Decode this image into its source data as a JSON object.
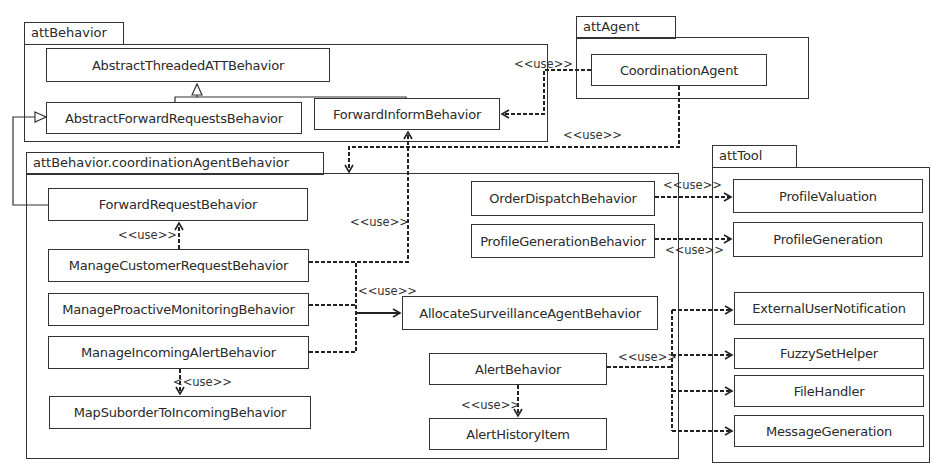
{
  "packages": {
    "attBehavior": "attBehavior",
    "attAgent": "attAgent",
    "coordination": "attBehavior.coordinationAgentBehavior",
    "attTool": "attTool"
  },
  "classes": {
    "abstractThreaded": "AbstractThreadedATTBehavior",
    "abstractForwardRequests": "AbstractForwardRequestsBehavior",
    "forwardInform": "ForwardInformBehavior",
    "coordinationAgent": "CoordinationAgent",
    "forwardRequest": "ForwardRequestBehavior",
    "manageCustomerRequest": "ManageCustomerRequestBehavior",
    "manageProactiveMonitoring": "ManageProactiveMonitoringBehavior",
    "manageIncomingAlert": "ManageIncomingAlertBehavior",
    "mapSuborder": "MapSuborderToIncomingBehavior",
    "orderDispatch": "OrderDispatchBehavior",
    "profileGenerationBehavior": "ProfileGenerationBehavior",
    "allocateSurveillance": "AllocateSurveillanceAgentBehavior",
    "alertBehavior": "AlertBehavior",
    "alertHistoryItem": "AlertHistoryItem",
    "profileValuation": "ProfileValuation",
    "profileGeneration": "ProfileGeneration",
    "externalUserNotification": "ExternalUserNotification",
    "fuzzySetHelper": "FuzzySetHelper",
    "fileHandler": "FileHandler",
    "messageGeneration": "MessageGeneration"
  },
  "labels": {
    "use": "<<use>>"
  }
}
